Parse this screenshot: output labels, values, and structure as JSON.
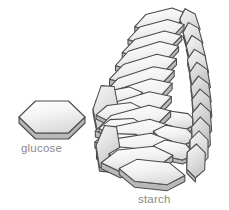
{
  "figure": {
    "background_color": "#ffffff",
    "width": 229,
    "height": 210
  },
  "style": {
    "outline_color": "#4a4a4a",
    "inner_line_color": "#6e6e6e",
    "face_light": "#fdfdfd",
    "face_mid": "#e6e6e6",
    "face_dark": "#c9c9c9",
    "side_face": "#b9b9b9",
    "label_color": "#8a8a8a"
  },
  "monomer": {
    "label": "glucose",
    "label_x": 21,
    "label_y": 152,
    "shape": "hexagonal-prism",
    "center_x": 52,
    "center_y": 117,
    "radius_x": 33,
    "radius_y": 16,
    "thickness": 6
  },
  "polymer": {
    "label": "starch",
    "label_x": 138,
    "label_y": 203,
    "shape": "helical-stack-of-hexagonal-prisms",
    "unit_count": 34,
    "center_x": 163,
    "top_y": 12,
    "bottom_y": 186,
    "description": "Helical column of hexagonal glucose units, tapering toward the top"
  },
  "units": [
    {
      "cx": 161,
      "cy": 20,
      "rx": 27,
      "ry": 9,
      "rot": -14,
      "shade": "light",
      "th": 5
    },
    {
      "cx": 190,
      "cy": 24,
      "rx": 16,
      "ry": 8,
      "rot": 72,
      "shade": "mid",
      "th": 4
    },
    {
      "cx": 156,
      "cy": 32,
      "rx": 29,
      "ry": 9,
      "rot": -15,
      "shade": "light",
      "th": 5
    },
    {
      "cx": 193,
      "cy": 38,
      "rx": 16,
      "ry": 8,
      "rot": 74,
      "shade": "mid",
      "th": 4
    },
    {
      "cx": 152,
      "cy": 44,
      "rx": 31,
      "ry": 9,
      "rot": -16,
      "shade": "light",
      "th": 5
    },
    {
      "cx": 196,
      "cy": 52,
      "rx": 17,
      "ry": 8,
      "rot": 76,
      "shade": "mid",
      "th": 4
    },
    {
      "cx": 147,
      "cy": 56,
      "rx": 33,
      "ry": 10,
      "rot": -17,
      "shade": "light",
      "th": 5
    },
    {
      "cx": 198,
      "cy": 66,
      "rx": 17,
      "ry": 9,
      "rot": 78,
      "shade": "mid",
      "th": 4
    },
    {
      "cx": 143,
      "cy": 69,
      "rx": 35,
      "ry": 10,
      "rot": -17,
      "shade": "light",
      "th": 6
    },
    {
      "cx": 200,
      "cy": 80,
      "rx": 18,
      "ry": 9,
      "rot": 80,
      "shade": "dark",
      "th": 4
    },
    {
      "cx": 139,
      "cy": 82,
      "rx": 37,
      "ry": 10,
      "rot": -18,
      "shade": "light",
      "th": 6
    },
    {
      "cx": 201,
      "cy": 94,
      "rx": 18,
      "ry": 9,
      "rot": 82,
      "shade": "dark",
      "th": 4
    },
    {
      "cx": 136,
      "cy": 95,
      "rx": 38,
      "ry": 11,
      "rot": -18,
      "shade": "light",
      "th": 6
    },
    {
      "cx": 202,
      "cy": 108,
      "rx": 19,
      "ry": 9,
      "rot": 84,
      "shade": "dark",
      "th": 4
    },
    {
      "cx": 134,
      "cy": 108,
      "rx": 39,
      "ry": 11,
      "rot": -17,
      "shade": "light",
      "th": 6
    },
    {
      "cx": 202,
      "cy": 122,
      "rx": 19,
      "ry": 9,
      "rot": 86,
      "shade": "dark",
      "th": 4
    },
    {
      "cx": 133,
      "cy": 121,
      "rx": 39,
      "ry": 11,
      "rot": -15,
      "shade": "light",
      "th": 6
    },
    {
      "cx": 201,
      "cy": 136,
      "rx": 19,
      "ry": 9,
      "rot": 88,
      "shade": "dark",
      "th": 4
    },
    {
      "cx": 133,
      "cy": 134,
      "rx": 39,
      "ry": 11,
      "rot": -12,
      "shade": "light",
      "th": 6
    },
    {
      "cx": 199,
      "cy": 149,
      "rx": 18,
      "ry": 9,
      "rot": 90,
      "shade": "mid",
      "th": 4
    },
    {
      "cx": 134,
      "cy": 147,
      "rx": 38,
      "ry": 11,
      "rot": -9,
      "shade": "light",
      "th": 6
    },
    {
      "cx": 196,
      "cy": 161,
      "rx": 17,
      "ry": 9,
      "rot": 92,
      "shade": "mid",
      "th": 4
    },
    {
      "cx": 137,
      "cy": 159,
      "rx": 36,
      "ry": 11,
      "rot": -6,
      "shade": "light",
      "th": 6
    },
    {
      "cx": 152,
      "cy": 172,
      "rx": 33,
      "ry": 11,
      "rot": 6,
      "shade": "light",
      "th": 6
    },
    {
      "cx": 106,
      "cy": 110,
      "rx": 13,
      "ry": 24,
      "rot": 4,
      "shade": "mid",
      "th": 4
    },
    {
      "cx": 108,
      "cy": 147,
      "rx": 12,
      "ry": 21,
      "rot": 7,
      "shade": "mid",
      "th": 4
    },
    {
      "cx": 119,
      "cy": 97,
      "rx": 24,
      "ry": 8,
      "rot": -11,
      "shade": "light",
      "th": 4
    },
    {
      "cx": 120,
      "cy": 112,
      "rx": 24,
      "ry": 8,
      "rot": -7,
      "shade": "light",
      "th": 4
    },
    {
      "cx": 122,
      "cy": 127,
      "rx": 23,
      "ry": 8,
      "rot": -3,
      "shade": "light",
      "th": 4
    },
    {
      "cx": 125,
      "cy": 142,
      "rx": 22,
      "ry": 8,
      "rot": 2,
      "shade": "light",
      "th": 4
    },
    {
      "cx": 130,
      "cy": 156,
      "rx": 21,
      "ry": 8,
      "rot": 6,
      "shade": "light",
      "th": 4
    },
    {
      "cx": 176,
      "cy": 120,
      "rx": 22,
      "ry": 8,
      "rot": 8,
      "shade": "light",
      "th": 4
    },
    {
      "cx": 175,
      "cy": 135,
      "rx": 22,
      "ry": 8,
      "rot": 10,
      "shade": "light",
      "th": 4
    },
    {
      "cx": 174,
      "cy": 150,
      "rx": 21,
      "ry": 8,
      "rot": 12,
      "shade": "light",
      "th": 4
    }
  ]
}
